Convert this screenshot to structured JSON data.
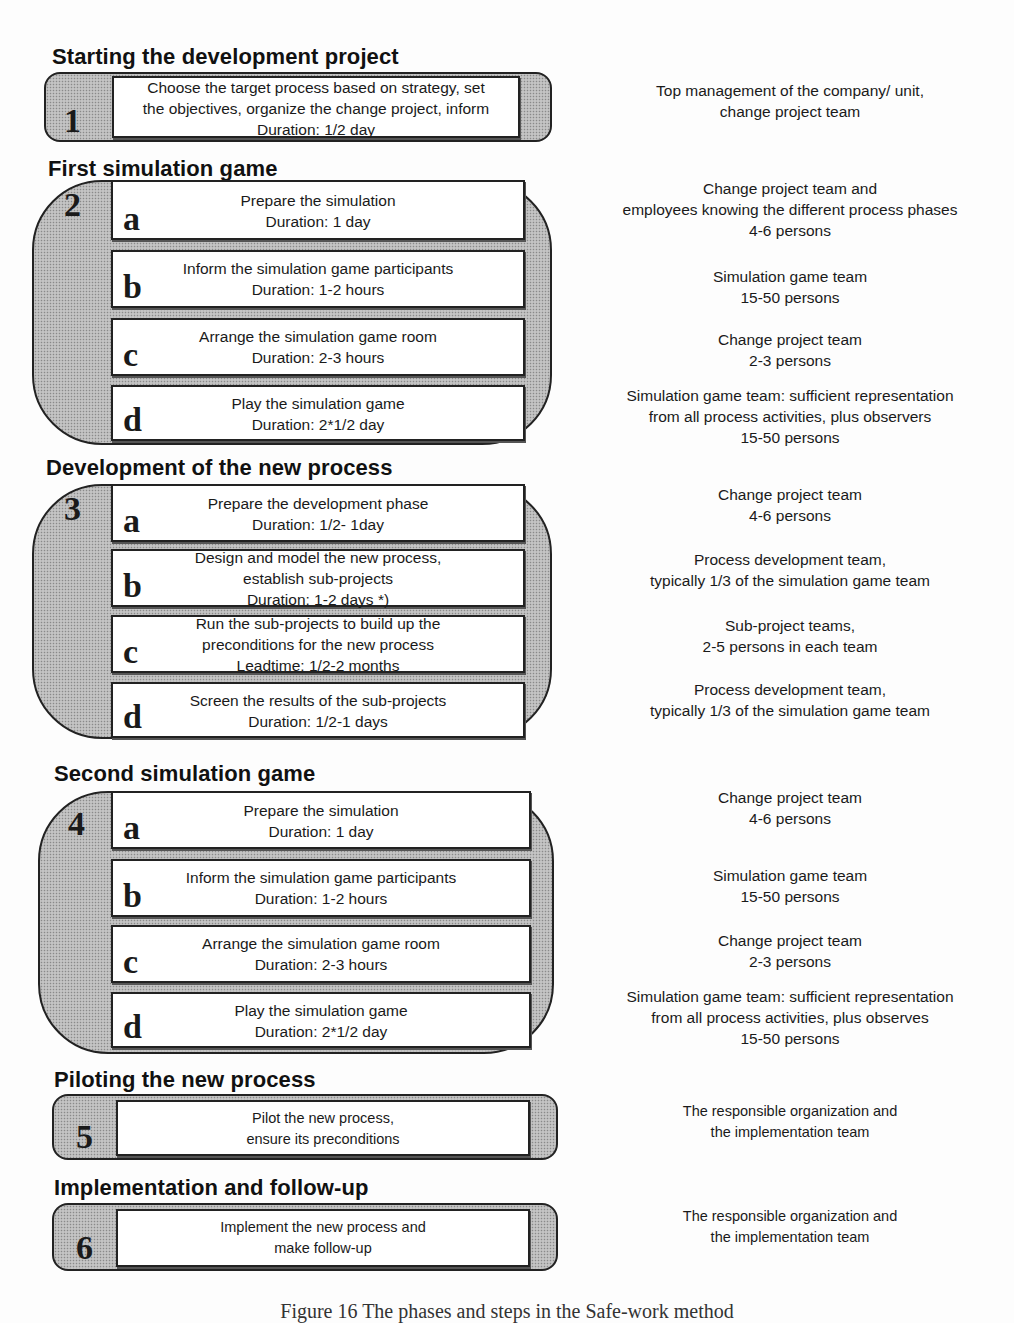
{
  "phases": [
    {
      "number": "1",
      "title": "Starting the development project",
      "steps": [
        {
          "letter": "",
          "lines": [
            "Choose the target process based on strategy, set",
            "the objectives, organize the change project, inform",
            "Duration: 1/2 day"
          ],
          "responsible": [
            "Top management of the company/ unit,",
            "change project team"
          ]
        }
      ]
    },
    {
      "number": "2",
      "title": "First simulation game",
      "steps": [
        {
          "letter": "a",
          "lines": [
            "Prepare the simulation",
            "Duration: 1 day"
          ],
          "responsible": [
            "Change project team and",
            "employees knowing the different process phases",
            "4-6 persons"
          ]
        },
        {
          "letter": "b",
          "lines": [
            "Inform the simulation game participants",
            "Duration: 1-2 hours"
          ],
          "responsible": [
            "Simulation game team",
            "15-50 persons"
          ]
        },
        {
          "letter": "c",
          "lines": [
            "Arrange the simulation game room",
            "Duration: 2-3 hours"
          ],
          "responsible": [
            "Change project team",
            "2-3 persons"
          ]
        },
        {
          "letter": "d",
          "lines": [
            "Play the simulation game",
            "Duration: 2*1/2 day"
          ],
          "responsible": [
            "Simulation game team: sufficient representation",
            "from all process activities, plus observers",
            "15-50 persons"
          ]
        }
      ]
    },
    {
      "number": "3",
      "title": "Development of the new process",
      "steps": [
        {
          "letter": "a",
          "lines": [
            "Prepare the development phase",
            "Duration: 1/2- 1day"
          ],
          "responsible": [
            "Change project team",
            "4-6 persons"
          ]
        },
        {
          "letter": "b",
          "lines": [
            "Design and model the new process,",
            "establish sub-projects",
            "Duration: 1-2 days *)"
          ],
          "responsible": [
            "Process development team,",
            "typically 1/3 of the simulation game team"
          ]
        },
        {
          "letter": "c",
          "lines": [
            "Run the sub-projects to build up the",
            "preconditions for the new  process",
            "Leadtime: 1/2-2 months"
          ],
          "responsible": [
            "Sub-project teams,",
            "2-5 persons in each team"
          ]
        },
        {
          "letter": "d",
          "lines": [
            "Screen the results of the sub-projects",
            "Duration: 1/2-1 days"
          ],
          "responsible": [
            "Process development team,",
            "typically 1/3 of the simulation game team"
          ]
        }
      ]
    },
    {
      "number": "4",
      "title": "Second simulation game",
      "steps": [
        {
          "letter": "a",
          "lines": [
            "Prepare the simulation",
            "Duration: 1 day"
          ],
          "responsible": [
            "Change project team",
            "4-6 persons"
          ]
        },
        {
          "letter": "b",
          "lines": [
            "Inform the simulation game participants",
            "Duration: 1-2 hours"
          ],
          "responsible": [
            "Simulation game team",
            "15-50 persons"
          ]
        },
        {
          "letter": "c",
          "lines": [
            "Arrange the simulation game room",
            "Duration: 2-3 hours"
          ],
          "responsible": [
            "Change project team",
            "2-3 persons"
          ]
        },
        {
          "letter": "d",
          "lines": [
            "Play the simulation game",
            "Duration: 2*1/2 day"
          ],
          "responsible": [
            "Simulation game team: sufficient representation",
            "from all process activities, plus observes",
            "15-50 persons"
          ]
        }
      ]
    },
    {
      "number": "5",
      "title": "Piloting the new process",
      "steps": [
        {
          "letter": "",
          "lines": [
            "Pilot the new  process,",
            "ensure its preconditions"
          ],
          "responsible": [
            "The responsible organization and",
            "the implementation team"
          ]
        }
      ]
    },
    {
      "number": "6",
      "title": "Implementation and follow-up",
      "steps": [
        {
          "letter": "",
          "lines": [
            "Implement the new process and",
            "make follow-up"
          ],
          "responsible": [
            "The responsible organization and",
            "the implementation team"
          ]
        }
      ]
    }
  ],
  "caption": "Figure 16 The phases and steps in the Safe-work method"
}
